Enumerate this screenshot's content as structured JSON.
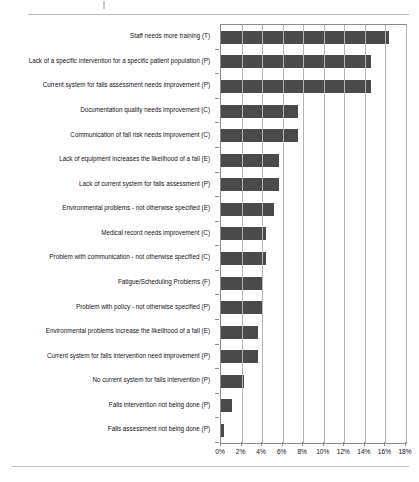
{
  "page": {
    "background_color": "#ffffff",
    "rule_color": "#b9b9b9"
  },
  "chart_data": {
    "type": "bar",
    "orientation": "horizontal",
    "title": "",
    "subtitle": "",
    "xlabel": "",
    "ylabel": "",
    "xlim": [
      0,
      18
    ],
    "xtick_labels": [
      "0%",
      "2%",
      "4%",
      "6%",
      "8%",
      "10%",
      "12%",
      "14%",
      "16%",
      "18%"
    ],
    "xtick_values": [
      0,
      2,
      4,
      6,
      8,
      10,
      12,
      14,
      16,
      18
    ],
    "grid": true,
    "legend": "none",
    "bar_color": "#4a4a4a",
    "value_unit": "%",
    "categories": [
      "Staff needs more training (T)",
      "Lack of a specific intervention for a specific patient population (P)",
      "Current system for falls assessment needs improvement (P)",
      "Documentation quality needs improvement (C)",
      "Communication of fall risk needs improvement (C)",
      "Lack of equipment increases the likelihood of a fall (E)",
      "Lack of current system for falls assessment (P)",
      "Environmental problems - not otherwise specified (E)",
      "Medical record needs improvement (C)",
      "Problem with communication - not otherwise specified (C)",
      "Fatigue/Scheduling Problems (F)",
      "Problem with policy - not otherwise specified (P)",
      "Environmental problems increase the likelihood of a fall (E)",
      "Current system for falls intervention need improvement (P)",
      "No current system for falls intervention (P)",
      "Falls intervention not being done (P)",
      "Falls assessment not being done (P)"
    ],
    "values": [
      16.3,
      14.6,
      14.6,
      7.5,
      7.5,
      5.6,
      5.6,
      5.2,
      4.4,
      4.4,
      4.0,
      4.0,
      3.6,
      3.6,
      2.2,
      1.1,
      0.25
    ]
  }
}
